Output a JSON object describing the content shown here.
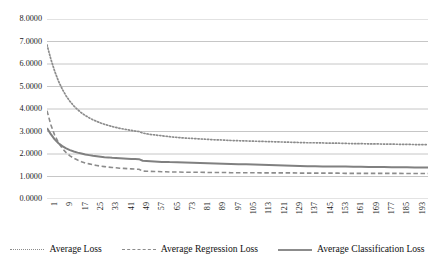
{
  "chart_data": {
    "type": "line",
    "title": "",
    "subtitle": "",
    "xlabel": "",
    "ylabel": "",
    "grid": "horizontal",
    "legend_position": "bottom",
    "ylim": [
      0.0,
      8.0
    ],
    "xlim": [
      1,
      200
    ],
    "y_ticks": [
      "0.0000",
      "1.0000",
      "2.0000",
      "3.0000",
      "4.0000",
      "5.0000",
      "6.0000",
      "7.0000",
      "8.0000"
    ],
    "y_tick_values": [
      0,
      1,
      2,
      3,
      4,
      5,
      6,
      7,
      8
    ],
    "x_ticks": [
      "1",
      "9",
      "17",
      "25",
      "33",
      "41",
      "49",
      "57",
      "65",
      "73",
      "81",
      "89",
      "97",
      "105",
      "113",
      "121",
      "129",
      "137",
      "145",
      "153",
      "161",
      "169",
      "177",
      "185",
      "193"
    ],
    "x_tick_values": [
      1,
      9,
      17,
      25,
      33,
      41,
      49,
      57,
      65,
      73,
      81,
      89,
      97,
      105,
      113,
      121,
      129,
      137,
      145,
      153,
      161,
      169,
      177,
      185,
      193
    ],
    "series": [
      {
        "name": "Average Loss",
        "style": "dotted",
        "color": "#8c8c8c",
        "x": [
          1,
          3,
          5,
          7,
          9,
          11,
          13,
          15,
          17,
          19,
          21,
          23,
          25,
          27,
          29,
          31,
          33,
          35,
          37,
          39,
          41,
          43,
          45,
          47,
          49,
          51,
          53,
          55,
          57,
          59,
          61,
          63,
          65,
          67,
          69,
          71,
          73,
          75,
          77,
          79,
          81,
          85,
          89,
          93,
          97,
          101,
          105,
          109,
          113,
          117,
          121,
          125,
          129,
          133,
          137,
          141,
          145,
          149,
          153,
          157,
          161,
          165,
          169,
          173,
          177,
          181,
          185,
          189,
          193,
          197,
          200
        ],
        "values": [
          6.85,
          6.22,
          5.68,
          5.24,
          4.88,
          4.58,
          4.34,
          4.14,
          3.97,
          3.83,
          3.71,
          3.61,
          3.52,
          3.45,
          3.38,
          3.32,
          3.27,
          3.22,
          3.18,
          3.14,
          3.11,
          3.08,
          3.05,
          3.02,
          3.0,
          2.93,
          2.9,
          2.87,
          2.85,
          2.83,
          2.81,
          2.79,
          2.77,
          2.75,
          2.74,
          2.72,
          2.71,
          2.7,
          2.69,
          2.68,
          2.67,
          2.65,
          2.63,
          2.62,
          2.6,
          2.59,
          2.58,
          2.57,
          2.56,
          2.55,
          2.54,
          2.53,
          2.52,
          2.51,
          2.5,
          2.5,
          2.49,
          2.48,
          2.48,
          2.47,
          2.46,
          2.46,
          2.45,
          2.45,
          2.44,
          2.44,
          2.43,
          2.43,
          2.42,
          2.42,
          2.42
        ]
      },
      {
        "name": "Average Regression Loss",
        "style": "dashed",
        "color": "#8c8c8c",
        "x": [
          1,
          3,
          5,
          7,
          9,
          11,
          13,
          15,
          17,
          19,
          21,
          23,
          25,
          27,
          29,
          31,
          33,
          35,
          37,
          39,
          41,
          43,
          45,
          47,
          49,
          51,
          53,
          55,
          57,
          59,
          61,
          63,
          65,
          69,
          73,
          77,
          81,
          85,
          89,
          93,
          97,
          101,
          105,
          109,
          113,
          117,
          121,
          125,
          129,
          133,
          137,
          141,
          145,
          149,
          153,
          157,
          161,
          165,
          169,
          173,
          177,
          181,
          185,
          189,
          193,
          197,
          200
        ],
        "values": [
          3.92,
          3.3,
          2.84,
          2.5,
          2.25,
          2.06,
          1.92,
          1.81,
          1.73,
          1.66,
          1.6,
          1.56,
          1.52,
          1.49,
          1.46,
          1.44,
          1.42,
          1.4,
          1.39,
          1.37,
          1.36,
          1.35,
          1.34,
          1.33,
          1.32,
          1.24,
          1.23,
          1.23,
          1.22,
          1.22,
          1.21,
          1.21,
          1.2,
          1.2,
          1.19,
          1.19,
          1.19,
          1.18,
          1.18,
          1.18,
          1.17,
          1.17,
          1.17,
          1.17,
          1.16,
          1.16,
          1.16,
          1.16,
          1.16,
          1.15,
          1.15,
          1.15,
          1.15,
          1.15,
          1.15,
          1.14,
          1.14,
          1.14,
          1.14,
          1.14,
          1.14,
          1.14,
          1.14,
          1.13,
          1.13,
          1.13,
          1.13
        ]
      },
      {
        "name": "Average Classification Loss",
        "style": "solid",
        "color": "#808080",
        "x": [
          1,
          3,
          5,
          7,
          9,
          11,
          13,
          15,
          17,
          19,
          21,
          23,
          25,
          27,
          29,
          31,
          33,
          35,
          37,
          39,
          41,
          43,
          45,
          47,
          49,
          51,
          53,
          55,
          57,
          59,
          61,
          63,
          65,
          69,
          73,
          77,
          81,
          85,
          89,
          93,
          97,
          101,
          105,
          109,
          113,
          117,
          121,
          125,
          129,
          133,
          137,
          141,
          145,
          149,
          153,
          157,
          161,
          165,
          169,
          173,
          177,
          181,
          185,
          189,
          193,
          197,
          200
        ],
        "values": [
          3.15,
          2.88,
          2.65,
          2.48,
          2.35,
          2.25,
          2.17,
          2.11,
          2.06,
          2.02,
          1.98,
          1.95,
          1.92,
          1.9,
          1.88,
          1.86,
          1.85,
          1.83,
          1.82,
          1.81,
          1.8,
          1.79,
          1.78,
          1.78,
          1.77,
          1.7,
          1.69,
          1.68,
          1.67,
          1.66,
          1.65,
          1.65,
          1.64,
          1.63,
          1.62,
          1.61,
          1.6,
          1.59,
          1.58,
          1.57,
          1.56,
          1.55,
          1.54,
          1.53,
          1.52,
          1.51,
          1.5,
          1.49,
          1.48,
          1.47,
          1.46,
          1.46,
          1.45,
          1.45,
          1.44,
          1.44,
          1.43,
          1.43,
          1.42,
          1.42,
          1.42,
          1.41,
          1.41,
          1.41,
          1.4,
          1.4,
          1.4
        ]
      }
    ]
  },
  "legend": {
    "items": [
      {
        "label": "Average Loss",
        "style": "dotted"
      },
      {
        "label": "Average Regression Loss",
        "style": "dashed"
      },
      {
        "label": "Average Classification Loss",
        "style": "solid"
      }
    ]
  },
  "colors": {
    "grid": "#bfbfbf",
    "series_gray": "#8c8c8c",
    "text": "#1a1a1a",
    "background": "#ffffff"
  }
}
